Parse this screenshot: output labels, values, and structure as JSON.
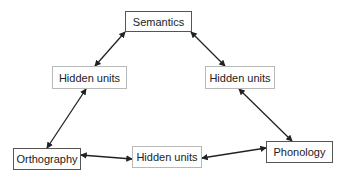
{
  "diagram": {
    "nodes": [
      {
        "id": "semantics",
        "label": "Semantics",
        "kind": "io",
        "x": 125,
        "y": 11,
        "w": 67,
        "h": 21
      },
      {
        "id": "hidden_left",
        "label": "Hidden units",
        "kind": "hidden",
        "x": 52,
        "y": 66,
        "w": 75,
        "h": 23
      },
      {
        "id": "hidden_right",
        "label": "Hidden units",
        "kind": "hidden",
        "x": 205,
        "y": 66,
        "w": 70,
        "h": 23
      },
      {
        "id": "orthography",
        "label": "Orthography",
        "kind": "io",
        "x": 13,
        "y": 148,
        "w": 68,
        "h": 22
      },
      {
        "id": "hidden_bottom",
        "label": "Hidden units",
        "kind": "hidden",
        "x": 132,
        "y": 146,
        "w": 70,
        "h": 22
      },
      {
        "id": "phonology",
        "label": "Phonology",
        "kind": "io",
        "x": 266,
        "y": 141,
        "w": 67,
        "h": 22
      }
    ],
    "edges": [
      {
        "from": "semantics",
        "to": "hidden_left",
        "x1": 125,
        "y1": 32,
        "x2": 95,
        "y2": 66,
        "bidirectional": true
      },
      {
        "from": "semantics",
        "to": "hidden_right",
        "x1": 191,
        "y1": 32,
        "x2": 225,
        "y2": 66,
        "bidirectional": true
      },
      {
        "from": "hidden_left",
        "to": "orthography",
        "x1": 86,
        "y1": 89,
        "x2": 47,
        "y2": 148,
        "bidirectional": true
      },
      {
        "from": "hidden_right",
        "to": "phonology",
        "x1": 239,
        "y1": 89,
        "x2": 292,
        "y2": 141,
        "bidirectional": true
      },
      {
        "from": "orthography",
        "to": "hidden_bottom",
        "x1": 81,
        "y1": 155,
        "x2": 132,
        "y2": 159,
        "bidirectional": true
      },
      {
        "from": "hidden_bottom",
        "to": "phonology",
        "x1": 202,
        "y1": 158,
        "x2": 266,
        "y2": 148,
        "bidirectional": true
      }
    ],
    "colors": {
      "edge": "#222222",
      "io_border": "#555555",
      "hidden_border": "#b8b8b8",
      "text": "#222222"
    }
  }
}
